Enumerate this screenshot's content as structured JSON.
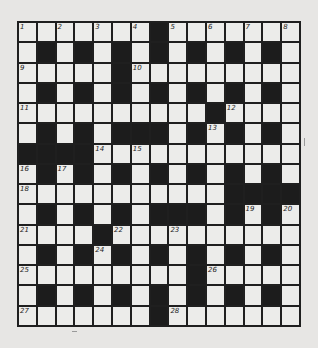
{
  "puzzle": {
    "rows": 15,
    "cols": 15,
    "colors": {
      "black": "#1c1c1c",
      "white": "#ececea",
      "paper": "#e7e6e4",
      "line": "#1f1f1f"
    },
    "grid": [
      "WWWWWWWBWWWWWWW",
      "WBWBWBWBWBWBWBW",
      "WWWWWBWWWWWWWWW",
      "WBWBWBWBWBWBWBW",
      "WWWWWWWWWWBWWWW",
      "WBWBWBBBWBWBWBW",
      "BBBBWWWWWWWWWWW",
      "WBWBWBWBWBWBWBW",
      "WWWWWWWWWWWBBBB",
      "WBWBWBWBBBWBWBW",
      "WWWWBWWWWWWWWWW",
      "WBWBWBWBWBWBWBW",
      "WWWWWWWWWBWWWWW",
      "WBWBWBWBWBWBWBW",
      "WWWWWWWBWWWWWWW"
    ],
    "numbers": [
      {
        "r": 0,
        "c": 0,
        "n": "1"
      },
      {
        "r": 0,
        "c": 2,
        "n": "2"
      },
      {
        "r": 0,
        "c": 4,
        "n": "3"
      },
      {
        "r": 0,
        "c": 6,
        "n": "4"
      },
      {
        "r": 0,
        "c": 8,
        "n": "5"
      },
      {
        "r": 0,
        "c": 10,
        "n": "6"
      },
      {
        "r": 0,
        "c": 12,
        "n": "7"
      },
      {
        "r": 0,
        "c": 14,
        "n": "8"
      },
      {
        "r": 2,
        "c": 0,
        "n": "9"
      },
      {
        "r": 2,
        "c": 6,
        "n": "10"
      },
      {
        "r": 4,
        "c": 0,
        "n": "11"
      },
      {
        "r": 4,
        "c": 11,
        "n": "12"
      },
      {
        "r": 5,
        "c": 10,
        "n": "13"
      },
      {
        "r": 6,
        "c": 4,
        "n": "14"
      },
      {
        "r": 6,
        "c": 6,
        "n": "15"
      },
      {
        "r": 7,
        "c": 0,
        "n": "16"
      },
      {
        "r": 7,
        "c": 2,
        "n": "17"
      },
      {
        "r": 8,
        "c": 0,
        "n": "18"
      },
      {
        "r": 9,
        "c": 12,
        "n": "19"
      },
      {
        "r": 9,
        "c": 14,
        "n": "20"
      },
      {
        "r": 10,
        "c": 0,
        "n": "21"
      },
      {
        "r": 10,
        "c": 5,
        "n": "22"
      },
      {
        "r": 10,
        "c": 8,
        "n": "23"
      },
      {
        "r": 11,
        "c": 4,
        "n": "24"
      },
      {
        "r": 12,
        "c": 0,
        "n": "25"
      },
      {
        "r": 12,
        "c": 10,
        "n": "26"
      },
      {
        "r": 14,
        "c": 0,
        "n": "27"
      },
      {
        "r": 14,
        "c": 8,
        "n": "28"
      }
    ]
  }
}
